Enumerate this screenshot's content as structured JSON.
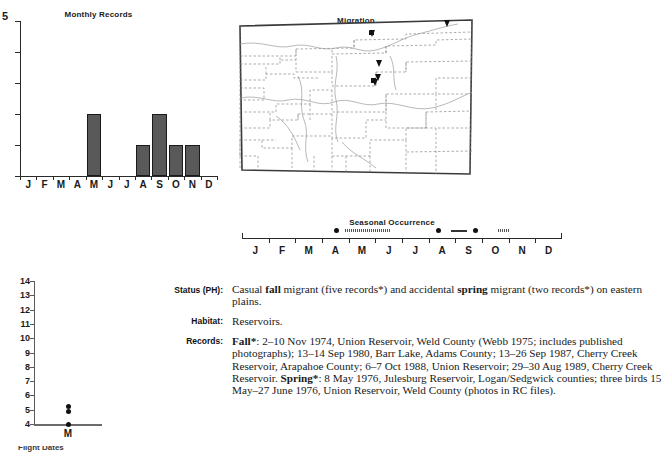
{
  "monthly_chart": {
    "caption": "Monthly Records",
    "y_top_label": "5",
    "months": [
      "J",
      "F",
      "M",
      "A",
      "M",
      "J",
      "J",
      "A",
      "S",
      "O",
      "N",
      "D"
    ]
  },
  "map": {
    "caption": "Migration"
  },
  "seasonal": {
    "caption": "Seasonal Occurrence",
    "months": [
      "J",
      "F",
      "M",
      "A",
      "M",
      "J",
      "J",
      "A",
      "S",
      "O",
      "N",
      "D"
    ]
  },
  "dotplot": {
    "y_labels": [
      "14",
      "13",
      "12",
      "11",
      "10",
      "9",
      "8",
      "7",
      "6",
      "5",
      "4"
    ],
    "x_categories": [
      "M"
    ],
    "clipped_caption": "Flight Dates"
  },
  "account": {
    "status_label": "Status (PH):",
    "status_text_1": "Casual ",
    "status_bold_1": "fall",
    "status_text_2": " migrant (five records*) and accidental ",
    "status_bold_2": "spring",
    "status_text_3": " migrant (two records*) on eastern plains.",
    "habitat_label": "Habitat:",
    "habitat_text": "Reservoirs.",
    "records_label": "Records:",
    "records_bold_1": "Fall*",
    "records_text_1": ": 2–10 Nov 1974, Union Reservoir, Weld County (Webb 1975; includes published photographs); 13–14 Sep 1980, Barr Lake, Adams County; 13–26 Sep 1987, Cherry Creek Reservoir, Arapahoe County; 6–7 Oct 1988, Union Reservoir; 29–30 Aug 1989, Cherry Creek Reservoir. ",
    "records_bold_2": "Spring*",
    "records_text_2": ": 8 May 1976, Julesburg Reservoir, Logan/Sedgwick counties; three birds 15 May–27 June 1976, Union Reservoir, Weld County (photos in RC files)."
  },
  "chart_data": [
    {
      "type": "bar",
      "title": "Monthly Records",
      "xlabel": "",
      "ylabel": "",
      "categories": [
        "J",
        "F",
        "M",
        "A",
        "M",
        "J",
        "J",
        "A",
        "S",
        "O",
        "N",
        "D"
      ],
      "values": [
        0,
        0,
        0,
        0,
        2,
        0,
        0,
        1,
        2,
        1,
        1,
        0
      ],
      "ylim": [
        0,
        5
      ],
      "ytick_labels": [
        "5"
      ],
      "grid": false,
      "legend": "none",
      "bar_color": "#595959"
    },
    {
      "type": "scatter",
      "title": "",
      "xlabel": "",
      "ylabel": "",
      "x": [
        "M",
        "M",
        "M"
      ],
      "y": [
        5.2,
        4.9,
        4.0
      ],
      "ylim": [
        4,
        14
      ],
      "ytick_labels": [
        "4",
        "5",
        "6",
        "7",
        "8",
        "9",
        "10",
        "11",
        "12",
        "13",
        "14"
      ],
      "categories": [
        "M"
      ],
      "grid": false,
      "legend": "none",
      "point_color": "#111111"
    },
    {
      "type": "table",
      "title": "Seasonal Occurrence",
      "categories": [
        "J",
        "F",
        "M",
        "A",
        "M",
        "J",
        "J",
        "A",
        "S",
        "O",
        "N",
        "D"
      ],
      "annotations": [
        {
          "kind": "dot",
          "month_start": 4.55,
          "month_end": 4.55
        },
        {
          "kind": "dotted",
          "month_start": 4.85,
          "month_end": 6.55
        },
        {
          "kind": "dot",
          "month_start": 8.35,
          "month_end": 8.35
        },
        {
          "kind": "solid",
          "month_start": 8.85,
          "month_end": 9.45
        },
        {
          "kind": "dot",
          "month_start": 9.75,
          "month_end": 9.75
        },
        {
          "kind": "dotted",
          "month_start": 10.6,
          "month_end": 11.0
        }
      ]
    }
  ],
  "map_data": {
    "type": "map",
    "region": "Colorado",
    "markers": [
      {
        "x": 0.565,
        "y": 0.115
      },
      {
        "x": 0.595,
        "y": 0.295
      },
      {
        "x": 0.592,
        "y": 0.375
      },
      {
        "x": 0.578,
        "y": 0.405
      },
      {
        "x": 0.888,
        "y": 0.055
      }
    ]
  }
}
